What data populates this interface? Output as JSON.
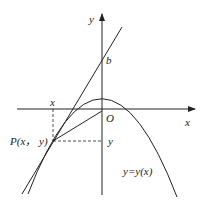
{
  "diagram": {
    "axes": {
      "x_label": "x",
      "y_label": "y",
      "origin_label": "O"
    },
    "labels": {
      "intercept": "b",
      "point": "P(x， y)",
      "x_projection": "x",
      "y_projection": "y",
      "curve": "y=y(x)"
    },
    "colors": {
      "stroke": "#222222",
      "background": "#ffffff"
    }
  }
}
